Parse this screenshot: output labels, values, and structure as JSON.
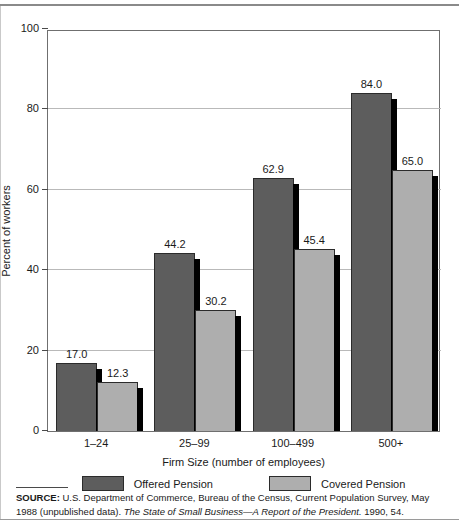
{
  "chart_data": {
    "type": "bar",
    "title": "",
    "subtitle": "",
    "categories": [
      "1–24",
      "25–99",
      "100–499",
      "500+"
    ],
    "series": [
      {
        "name": "Offered Pension",
        "color": "#5d5d5d",
        "values": [
          17.0,
          44.2,
          62.9,
          84.0
        ],
        "labels": [
          "17.0",
          "44.2",
          "62.9",
          "84.0"
        ]
      },
      {
        "name": "Covered Pension",
        "color": "#aeaeae",
        "values": [
          12.3,
          30.2,
          45.4,
          65.0
        ],
        "labels": [
          "12.3",
          "30.2",
          "45.4",
          "65.0"
        ]
      }
    ],
    "xlabel": "Firm Size (number of employees)",
    "ylabel": "Percent of workers",
    "ylim": [
      0,
      100
    ],
    "ytick_labels": [
      "0",
      "20",
      "40",
      "60",
      "80",
      "100"
    ],
    "ytick_values": [
      0,
      20,
      40,
      60,
      80,
      100
    ],
    "grid": "horizontal",
    "legend_position": "bottom-center",
    "data_labels": true
  },
  "axes": {
    "y_title": "Percent of workers",
    "x_title": "Firm Size (number of employees)"
  },
  "legend": {
    "items": [
      {
        "label": "Offered Pension",
        "color": "#5d5d5d"
      },
      {
        "label": "Covered Pension",
        "color": "#aeaeae"
      }
    ]
  },
  "source": {
    "head": "SOURCE:",
    "text_before_title": " U.S. Department of Commerce, Bureau of the Census, Current Population Survey, May 1988 (unpublished data). ",
    "title": "The State of Small Business—A Report of the President.",
    "text_after_title": " 1990, 54."
  },
  "colors": {
    "offered": "#5d5d5d",
    "covered": "#aeaeae",
    "shadow": "#000000",
    "gridline": "#b9b9b9",
    "frame": "#6f6f6f"
  }
}
